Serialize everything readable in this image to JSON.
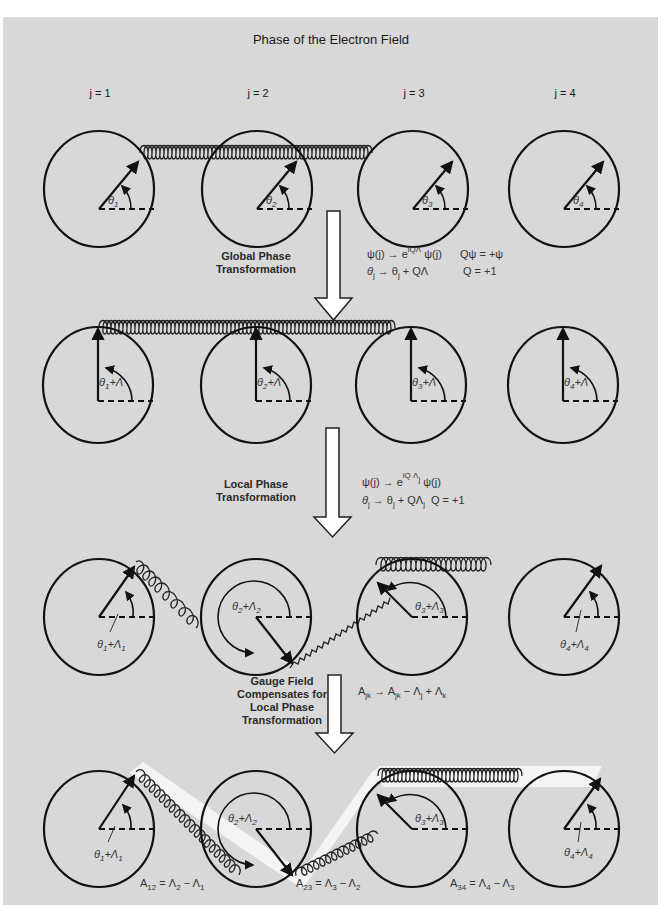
{
  "title": "Phase of the Electron Field",
  "site_labels": [
    "j = 1",
    "j = 2",
    "j = 3",
    "j = 4"
  ],
  "steps": [
    {
      "label_lines": [
        "Global Phase",
        "Transformation"
      ],
      "equations": {
        "line1_left": "ψ(j) → e",
        "line1_sup": "iQΛ",
        "line1_right": " ψ(j)",
        "line1_extra": "Qψ = +ψ",
        "line2_left": "θ",
        "line2_sub1": "j",
        "line2_mid": " → θ",
        "line2_sub2": "j",
        "line2_right": " + QΛ",
        "line2_extra": "Q = +1"
      }
    },
    {
      "label_lines": [
        "Local Phase",
        "Transformation"
      ],
      "equations": {
        "line1_left": "ψ(j) → e",
        "line1_sup": "iQ Λ",
        "line1_supsub": "j",
        "line1_right": " ψ(j)",
        "line2_left": "θ",
        "line2_sub1": "j",
        "line2_mid": " → θ",
        "line2_sub2": "j",
        "line2_right": " + QΛ",
        "line2_sub3": "j",
        "line2_extra": "Q = +1"
      }
    },
    {
      "label_lines": [
        "Gauge Field",
        "Compensates for",
        "Local Phase",
        "Transformation"
      ],
      "equations": {
        "line1_a": "A",
        "line1_asub": "jk",
        "line1_b": " → A",
        "line1_bsub": "jk",
        "line1_c": " − Λ",
        "line1_csub": "j",
        "line1_d": " + Λ",
        "line1_dsub": "k"
      }
    }
  ],
  "rows": [
    {
      "name": "original",
      "angle_labels": [
        {
          "base": "θ",
          "sub": "1",
          "suffix": ""
        },
        {
          "base": "θ",
          "sub": "2",
          "suffix": ""
        },
        {
          "base": "θ",
          "sub": "3",
          "suffix": ""
        },
        {
          "base": "θ",
          "sub": "4",
          "suffix": ""
        }
      ]
    },
    {
      "name": "global",
      "angle_labels": [
        {
          "base": "θ",
          "sub": "1",
          "suffix": "+Λ"
        },
        {
          "base": "θ",
          "sub": "2",
          "suffix": "+Λ"
        },
        {
          "base": "θ",
          "sub": "3",
          "suffix": "+Λ"
        },
        {
          "base": "θ",
          "sub": "4",
          "suffix": "+Λ"
        }
      ]
    },
    {
      "name": "local",
      "angle_labels": [
        {
          "base": "θ",
          "sub": "1",
          "suffix": "+Λ",
          "suffix_sub": "1"
        },
        {
          "base": "θ",
          "sub": "2",
          "suffix": "+Λ",
          "suffix_sub": "2"
        },
        {
          "base": "θ",
          "sub": "3",
          "suffix": "+Λ",
          "suffix_sub": "3"
        },
        {
          "base": "θ",
          "sub": "4",
          "suffix": "+Λ",
          "suffix_sub": "4"
        }
      ]
    },
    {
      "name": "gauge",
      "angle_labels": [
        {
          "base": "θ",
          "sub": "1",
          "suffix": "+Λ",
          "suffix_sub": "1"
        },
        {
          "base": "θ",
          "sub": "2",
          "suffix": "+Λ",
          "suffix_sub": "2"
        },
        {
          "base": "θ",
          "sub": "3",
          "suffix": "+Λ",
          "suffix_sub": "3"
        },
        {
          "base": "θ",
          "sub": "4",
          "suffix": "+Λ",
          "suffix_sub": "4"
        }
      ]
    }
  ],
  "gauge_fields": [
    {
      "a": "A",
      "a_sub": "12",
      "eq": " = Λ",
      "s1": "2",
      "minus": " − Λ",
      "s2": "1"
    },
    {
      "a": "A",
      "a_sub": "23",
      "eq": " = Λ",
      "s1": "3",
      "minus": " − Λ",
      "s2": "2"
    },
    {
      "a": "A",
      "a_sub": "34",
      "eq": " = Λ",
      "s1": "4",
      "minus": " − Λ",
      "s2": "3"
    }
  ],
  "colors": {
    "background": "#ffffff",
    "panel": "#d8d8d8",
    "ink": "#111111",
    "band": "#f4f4f4",
    "arrow_fill": "#ffffff"
  }
}
